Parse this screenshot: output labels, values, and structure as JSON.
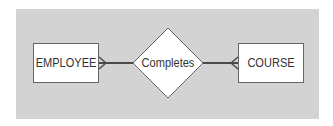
{
  "diagram": {
    "type": "entity-relationship",
    "entities": [
      {
        "id": "employee",
        "label": "EMPLOYEE"
      },
      {
        "id": "course",
        "label": "COURSE"
      }
    ],
    "relationship": {
      "label": "Completes",
      "shape": "diamond",
      "connections": [
        {
          "entity": "employee",
          "cardinality": "many",
          "notation": "crow-foot"
        },
        {
          "entity": "course",
          "cardinality": "many",
          "notation": "crow-foot"
        }
      ]
    },
    "colors": {
      "background_panel": "#d3d3d3",
      "shape_fill": "#ffffff",
      "line": "#555555",
      "text": "#333333"
    }
  }
}
